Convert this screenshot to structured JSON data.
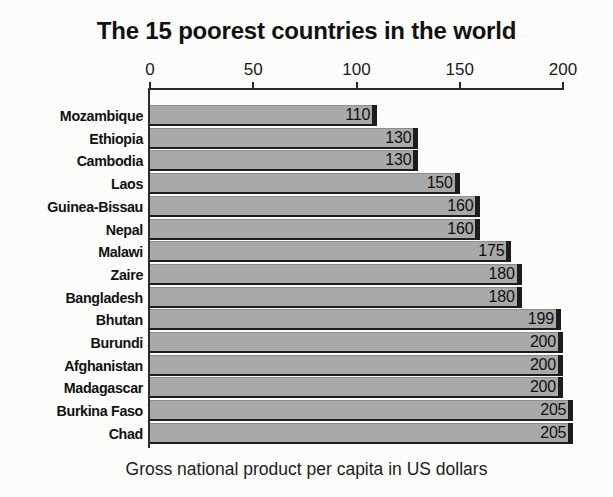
{
  "chart_data": {
    "type": "bar",
    "orientation": "horizontal",
    "title": "The 15 poorest countries in the world",
    "caption": "Gross national product per capita in US dollars",
    "xlabel": "",
    "ylabel": "",
    "xlim": [
      0,
      200
    ],
    "axis_max_pixels_value": 215,
    "grid": false,
    "legend": null,
    "tick_labels": [
      "0",
      "50",
      "100",
      "150",
      "200"
    ],
    "tick_values": [
      0,
      50,
      100,
      150,
      200
    ],
    "categories": [
      "Mozambique",
      "Ethiopia",
      "Cambodia",
      "Laos",
      "Guinea-Bissau",
      "Nepal",
      "Malawi",
      "Zaire",
      "Bangladesh",
      "Bhutan",
      "Burundi",
      "Afghanistan",
      "Madagascar",
      "Burkina Faso",
      "Chad"
    ],
    "values": [
      110,
      130,
      130,
      150,
      160,
      160,
      175,
      180,
      180,
      199,
      200,
      200,
      200,
      205,
      205
    ],
    "value_labels": [
      "110",
      "130",
      "130",
      "150",
      "160",
      "160",
      "175",
      "180",
      "180",
      "199",
      "200",
      "200",
      "200",
      "205",
      "205"
    ],
    "bars": [
      {
        "label": "Mozambique",
        "value": 110,
        "value_label": "110"
      },
      {
        "label": "Ethiopia",
        "value": 130,
        "value_label": "130"
      },
      {
        "label": "Cambodia",
        "value": 130,
        "value_label": "130"
      },
      {
        "label": "Laos",
        "value": 150,
        "value_label": "150"
      },
      {
        "label": "Guinea-Bissau",
        "value": 160,
        "value_label": "160"
      },
      {
        "label": "Nepal",
        "value": 160,
        "value_label": "160"
      },
      {
        "label": "Malawi",
        "value": 175,
        "value_label": "175"
      },
      {
        "label": "Zaire",
        "value": 180,
        "value_label": "180"
      },
      {
        "label": "Bangladesh",
        "value": 180,
        "value_label": "180"
      },
      {
        "label": "Bhutan",
        "value": 199,
        "value_label": "199"
      },
      {
        "label": "Burundi",
        "value": 200,
        "value_label": "200"
      },
      {
        "label": "Afghanistan",
        "value": 200,
        "value_label": "200"
      },
      {
        "label": "Madagascar",
        "value": 200,
        "value_label": "200"
      },
      {
        "label": "Burkina Faso",
        "value": 205,
        "value_label": "205"
      },
      {
        "label": "Chad",
        "value": 205,
        "value_label": "205"
      }
    ],
    "colors": {
      "bar_fill": "#a9a9a9",
      "bar_edge": "#1d1d1d",
      "axis": "#2b2b2b",
      "text": "#111111",
      "background": "#fdfdfc"
    }
  }
}
